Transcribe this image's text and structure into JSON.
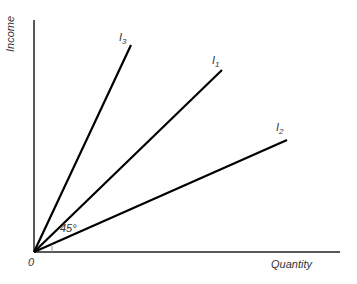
{
  "axes": {
    "y_label": "Income",
    "x_label": "Quantity",
    "origin_label": "0"
  },
  "lines": [
    {
      "name": "I",
      "sub": "3",
      "x2": 131,
      "y2": 45
    },
    {
      "name": "I",
      "sub": "1",
      "x2": 222,
      "y2": 70
    },
    {
      "name": "I",
      "sub": "2",
      "x2": 287,
      "y2": 140
    }
  ],
  "angle_label": "45°",
  "colors": {
    "line": "#000000",
    "text": "#333333"
  }
}
